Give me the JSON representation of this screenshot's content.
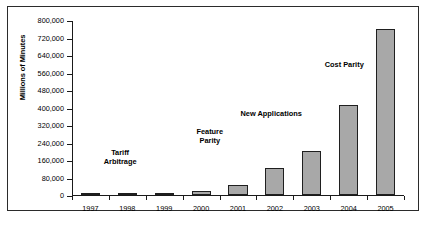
{
  "chart_data": {
    "type": "bar",
    "title": "",
    "xlabel": "",
    "ylabel": "Millions of Minutes",
    "categories": [
      "1997",
      "1998",
      "1999",
      "2000",
      "2001",
      "2002",
      "2003",
      "2004",
      "2005"
    ],
    "values": [
      1500,
      2500,
      6000,
      18000,
      45000,
      125000,
      200000,
      410000,
      760000
    ],
    "ylim": [
      0,
      800000
    ],
    "yticks": [
      0,
      80000,
      160000,
      240000,
      320000,
      400000,
      480000,
      560000,
      640000,
      720000,
      800000
    ],
    "ytick_labels": [
      "0",
      "80,000",
      "160,000",
      "240,000",
      "320,000",
      "400,000",
      "480,000",
      "560,000",
      "640,000",
      "720,000",
      "800,000"
    ],
    "grid": false,
    "legend": false,
    "bar_fill": "#a8a8a8",
    "bar_stroke": "#1f1f1f",
    "annotations": [
      {
        "text_lines": [
          "Tariff",
          "Arbitrage"
        ],
        "x_pct": 14.5,
        "y_pct": 72.5
      },
      {
        "text_lines": [
          "Feature",
          "Parity"
        ],
        "x_pct": 41.5,
        "y_pct": 60.5
      },
      {
        "text_lines": [
          "New Applications"
        ],
        "x_pct": 60.0,
        "y_pct": 50.0
      },
      {
        "text_lines": [
          "Cost Parity"
        ],
        "x_pct": 82.0,
        "y_pct": 22.5
      }
    ]
  }
}
